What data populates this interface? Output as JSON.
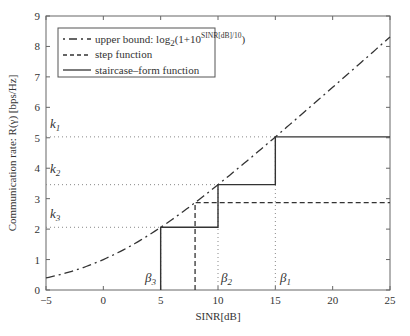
{
  "chart_data": {
    "type": "line",
    "title": "",
    "xlabel": "SINR[dB]",
    "ylabel": "Communication rate: R(γ) [bps/Hz]",
    "xlim": [
      -5,
      25
    ],
    "ylim": [
      0,
      9
    ],
    "xticks": [
      -5,
      0,
      5,
      10,
      15,
      20,
      25
    ],
    "yticks": [
      0,
      1,
      2,
      3,
      4,
      5,
      6,
      7,
      8,
      9
    ],
    "grid": false,
    "legend_position": "upper left",
    "legend": [
      {
        "style": "dash-dot",
        "label_prefix": "upper bound: log",
        "label_sub": "2",
        "label_mid": "(1+10",
        "label_sup": "SINR[dB]/10",
        "label_suffix": ")"
      },
      {
        "style": "dashed",
        "label": "step function"
      },
      {
        "style": "solid",
        "label": "staircase–form function"
      }
    ],
    "series": [
      {
        "name": "upper bound: log2(1+10^(SINR[dB]/10))",
        "style": "dash-dot",
        "function": "log2(1+10^(x/10))",
        "x": [
          -5,
          0,
          5,
          8,
          10,
          15,
          20,
          25
        ],
        "y": [
          0.4,
          1.0,
          2.06,
          2.85,
          3.46,
          5.03,
          6.66,
          8.3
        ]
      },
      {
        "name": "step function",
        "style": "dashed",
        "x": [
          8,
          8,
          25
        ],
        "y": [
          0,
          2.87,
          2.87
        ]
      },
      {
        "name": "staircase-form function",
        "style": "solid",
        "x": [
          5,
          5,
          10,
          10,
          15,
          15,
          25
        ],
        "y": [
          0,
          2.06,
          2.06,
          3.46,
          3.46,
          5.03,
          5.03
        ]
      }
    ],
    "reference_lines": {
      "horizontal": [
        {
          "label": "k1",
          "y": 5.03
        },
        {
          "label": "k2",
          "y": 3.46
        },
        {
          "label": "k3",
          "y": 2.06
        }
      ],
      "vertical": [
        {
          "label": "β1",
          "x": 15
        },
        {
          "label": "β2",
          "x": 10
        },
        {
          "label": "β3",
          "x": 5
        }
      ]
    }
  },
  "labels": {
    "xlabel": "SINR[dB]",
    "ylabel": "Communication rate: R(γ) [bps/Hz]",
    "k1": "k",
    "k1_sub": "1",
    "k2": "k",
    "k2_sub": "2",
    "k3": "k",
    "k3_sub": "3",
    "b1": "β",
    "b1_sub": "1",
    "b2": "β",
    "b2_sub": "2",
    "b3": "β",
    "b3_sub": "3",
    "legend_upper_prefix": "upper bound: log",
    "legend_upper_sub": "2",
    "legend_upper_mid": "(1+10",
    "legend_upper_sup": "SINR[dB]/10",
    "legend_upper_suffix": ")",
    "legend_step": "step function",
    "legend_stair": "staircase–form function"
  },
  "colors": {
    "line": "#333333",
    "axis": "#555555",
    "ref": "#888888"
  }
}
